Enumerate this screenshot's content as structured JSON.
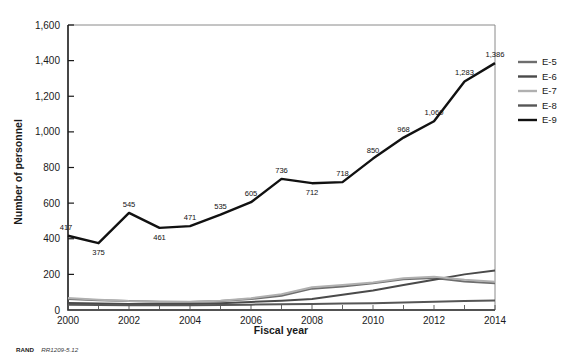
{
  "figure": {
    "footer_brand": "RAND",
    "footer_id": "RR1209-5.12"
  },
  "chart_data": {
    "type": "line",
    "title": "",
    "xlabel": "Fiscal year",
    "ylabel": "Number of personnel",
    "x": [
      2000,
      2001,
      2002,
      2003,
      2004,
      2005,
      2006,
      2007,
      2008,
      2009,
      2010,
      2011,
      2012,
      2013,
      2014
    ],
    "xtick_labels": [
      "2000",
      "2002",
      "2004",
      "2006",
      "2008",
      "2010",
      "2012",
      "2014"
    ],
    "xticks": [
      2000,
      2002,
      2004,
      2006,
      2008,
      2010,
      2012,
      2014
    ],
    "ytick_labels": [
      "0",
      "200",
      "400",
      "600",
      "800",
      "1,000",
      "1,200",
      "1,400",
      "1,600"
    ],
    "yticks": [
      0,
      200,
      400,
      600,
      800,
      1000,
      1200,
      1400,
      1600
    ],
    "xlim": [
      2000,
      2014
    ],
    "ylim": [
      0,
      1600
    ],
    "grid": false,
    "legend_position": "right",
    "series": [
      {
        "name": "E-5",
        "color": "#6e6e6e",
        "width": 2.0,
        "values": [
          62,
          55,
          50,
          47,
          45,
          50,
          62,
          80,
          120,
          132,
          150,
          172,
          180,
          160,
          150
        ],
        "labels": []
      },
      {
        "name": "E-6",
        "color": "#4a4a4a",
        "width": 2.0,
        "values": [
          40,
          36,
          34,
          33,
          34,
          38,
          45,
          52,
          62,
          85,
          110,
          140,
          170,
          200,
          222
        ],
        "labels": []
      },
      {
        "name": "E-7",
        "color": "#b0b0b0",
        "width": 2.0,
        "values": [
          68,
          58,
          50,
          46,
          46,
          52,
          66,
          88,
          128,
          140,
          155,
          178,
          186,
          170,
          158
        ],
        "labels": []
      },
      {
        "name": "E-8",
        "color": "#565656",
        "width": 2.0,
        "values": [
          30,
          28,
          27,
          26,
          26,
          28,
          30,
          32,
          34,
          36,
          38,
          42,
          46,
          50,
          54
        ],
        "labels": []
      },
      {
        "name": "E-9",
        "color": "#111111",
        "width": 2.4,
        "values": [
          417,
          375,
          545,
          461,
          471,
          535,
          605,
          736,
          712,
          718,
          850,
          968,
          1060,
          1283,
          1386
        ],
        "labels": [
          "417",
          "375",
          "545",
          "461",
          "471",
          "535",
          "605",
          "736",
          "712",
          "718",
          "850",
          "968",
          "1,060",
          "1,283",
          "1,386"
        ]
      }
    ]
  },
  "legend": {
    "items": [
      {
        "label": "E-5",
        "color": "#6e6e6e"
      },
      {
        "label": "E-6",
        "color": "#4a4a4a"
      },
      {
        "label": "E-7",
        "color": "#b0b0b0"
      },
      {
        "label": "E-8",
        "color": "#565656"
      },
      {
        "label": "E-9",
        "color": "#111111"
      }
    ]
  }
}
